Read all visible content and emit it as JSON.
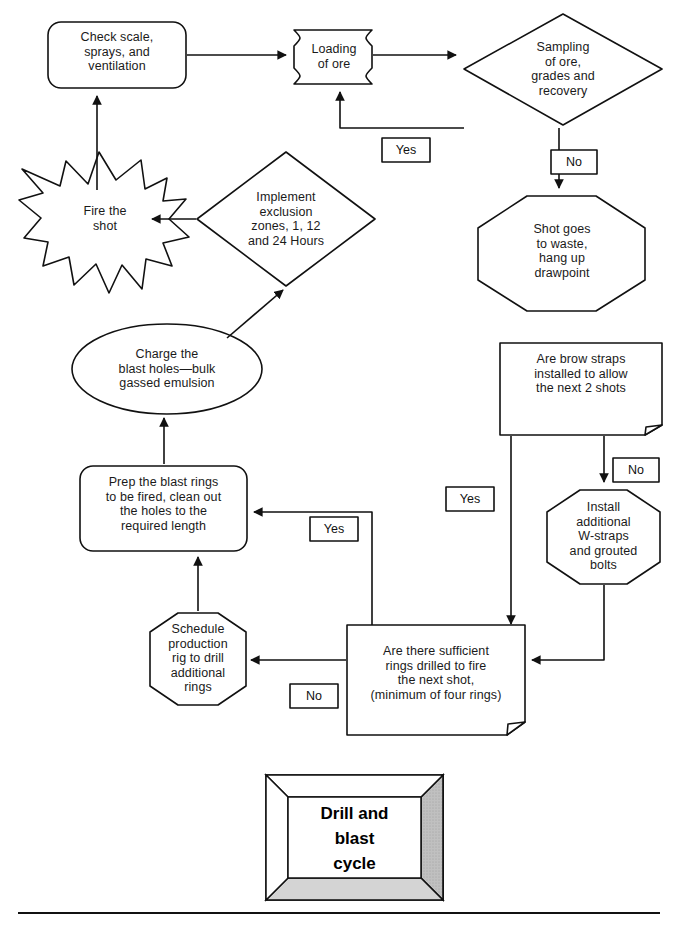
{
  "diagram": {
    "title": "Drill and\nblast\ncycle",
    "nodes": {
      "check_scale": "Check scale,\nsprays, and\nventilation",
      "loading_of_ore": "Loading\nof ore",
      "sampling_of_ore": "Sampling\nof ore,\ngrades and\nrecovery",
      "shot_to_waste": "Shot goes\nto waste,\nhang up\ndrawpoint",
      "fire_the_shot": "Fire the\nshot",
      "implement_exclusion_zones": "Implement\nexclusion\nzones, 1, 12\nand 24 Hours",
      "charge_blast_holes": "Charge the\nblast holes—bulk\ngassed emulsion",
      "prep_blast_rings": "Prep the blast rings\nto be fired, clean out\nthe holes to the\nrequired length",
      "brow_straps": "Are brow straps\ninstalled to allow\nthe next 2 shots",
      "install_w_straps": "Install\nadditional\nW-straps\nand grouted\nbolts",
      "schedule_production": "Schedule\nproduction\nrig to drill\nadditional\nrings",
      "sufficient_rings": "Are there sufficient\nrings drilled to fire\nthe next shot,\n(minimum of four rings)"
    },
    "edge_labels": {
      "sampling_yes": "Yes",
      "sampling_no": "No",
      "brow_straps_no": "No",
      "brow_straps_yes": "Yes",
      "sufficient_rings_yes": "Yes",
      "sufficient_rings_no": "No"
    },
    "colors": {
      "stroke": "#111111",
      "fill": "#ffffff",
      "title_box_shade": "#b5b5b5",
      "title_box_shade_light": "#cfcfcf",
      "text": "#1a1a1a"
    }
  }
}
